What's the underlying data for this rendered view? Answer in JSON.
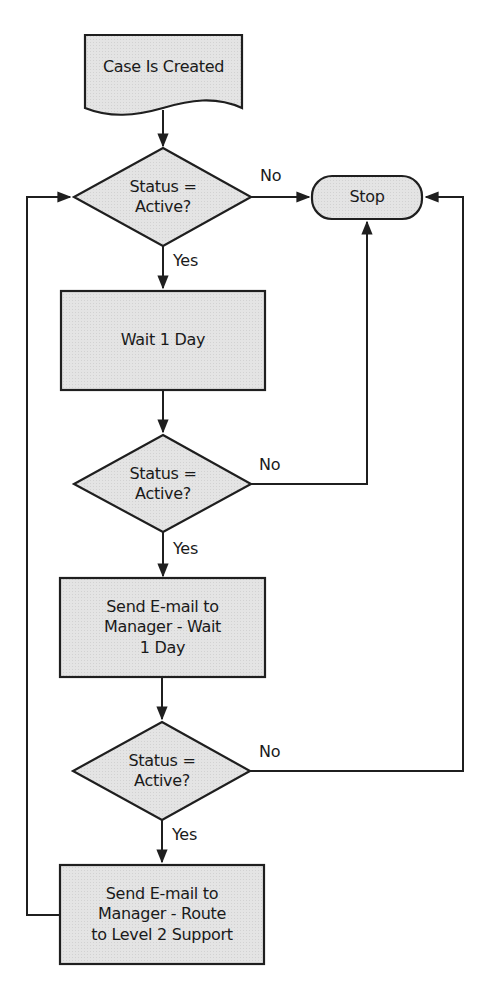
{
  "diagram": {
    "type": "flowchart",
    "colors": {
      "shape_fill": "#e2e2e2",
      "stroke": "#1f1f1f",
      "text": "#1a1a1a",
      "background": "#ffffff"
    },
    "nodes": [
      {
        "id": "start",
        "shape": "document",
        "label": "Case Is Created"
      },
      {
        "id": "decision1",
        "shape": "diamond",
        "label": "Status =\nActive?"
      },
      {
        "id": "stop",
        "shape": "terminator",
        "label": "Stop"
      },
      {
        "id": "wait1",
        "shape": "process",
        "label": "Wait 1 Day"
      },
      {
        "id": "decision2",
        "shape": "diamond",
        "label": "Status =\nActive?"
      },
      {
        "id": "email_wait",
        "shape": "process",
        "label": "Send E-mail to\nManager - Wait\n1 Day"
      },
      {
        "id": "decision3",
        "shape": "diamond",
        "label": "Status =\nActive?"
      },
      {
        "id": "email_route",
        "shape": "process",
        "label": "Send E-mail to\nManager - Route\nto Level 2 Support"
      }
    ],
    "edges": [
      {
        "from": "start",
        "to": "decision1",
        "label": ""
      },
      {
        "from": "decision1",
        "to": "stop",
        "label": "No"
      },
      {
        "from": "decision1",
        "to": "wait1",
        "label": "Yes"
      },
      {
        "from": "wait1",
        "to": "decision2",
        "label": ""
      },
      {
        "from": "decision2",
        "to": "stop",
        "label": "No"
      },
      {
        "from": "decision2",
        "to": "email_wait",
        "label": "Yes"
      },
      {
        "from": "email_wait",
        "to": "decision3",
        "label": ""
      },
      {
        "from": "decision3",
        "to": "stop",
        "label": "No"
      },
      {
        "from": "decision3",
        "to": "email_route",
        "label": "Yes"
      },
      {
        "from": "email_route",
        "to": "decision1",
        "label": ""
      }
    ]
  }
}
